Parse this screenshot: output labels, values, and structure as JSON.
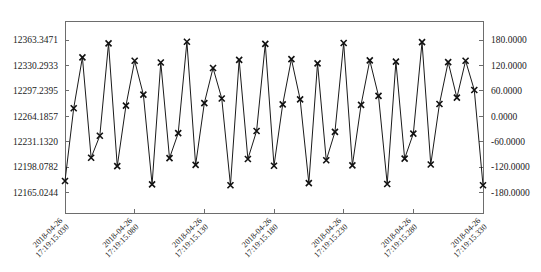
{
  "chart_data": {
    "type": "line",
    "title": "",
    "xlabel": "",
    "ylabel": "",
    "grid": false,
    "legend": "none",
    "marker": "x",
    "line_color": "#1a1a1a",
    "axis_color": "#6d6d6d",
    "background": "#ffffff",
    "left_axis": {
      "ticks": [
        12363.3471,
        12330.2933,
        12297.2395,
        12264.1857,
        12231.132,
        12198.0782,
        12165.0244
      ],
      "labels": [
        "12363.3471",
        "12330.2933",
        "12297.2395",
        "12264.1857",
        "12231.1320",
        "12198.0782",
        "12165.0244"
      ],
      "min": 12165.0244,
      "max": 12363.3471
    },
    "right_axis": {
      "ticks": [
        180.0,
        120.0,
        60.0,
        0.0,
        -60.0,
        -120.0,
        -180.0
      ],
      "labels": [
        "180.0000",
        "120.0000",
        "60.0000",
        "0.0000",
        "-60.0000",
        "-120.0000",
        "-180.0000"
      ],
      "min": -180.0,
      "max": 180.0
    },
    "x_tick_labels": [
      {
        "date": "2018-04-26",
        "time": "17:19:15.030"
      },
      {
        "date": "2018-04-26",
        "time": "17:19:15.080"
      },
      {
        "date": "2018-04-26",
        "time": "17:19:15.130"
      },
      {
        "date": "2018-04-26",
        "time": "17:19:15.180"
      },
      {
        "date": "2018-04-26",
        "time": "17:19:15.230"
      },
      {
        "date": "2018-04-26",
        "time": "17:19:15.280"
      },
      {
        "date": "2018-04-26",
        "time": "17:19:15.330"
      }
    ],
    "x": [
      0.0,
      1.0,
      2.0,
      3.0,
      4.0,
      5.0,
      6.0,
      7.0,
      8.0,
      9.0,
      10.0,
      11.0,
      12.0,
      13.0,
      14.0,
      15.0,
      16.0,
      17.0,
      18.0,
      19.0,
      20.0,
      21.0,
      22.0,
      23.0,
      24.0,
      25.0,
      26.0,
      27.0,
      28.0,
      29.0,
      30.0,
      31.0,
      32.0,
      33.0,
      34.0,
      35.0,
      36.0,
      37.0,
      38.0,
      39.0,
      40.0,
      41.0,
      42.0,
      43.0,
      44.0,
      45.0,
      46.0,
      47.0,
      48.0
    ],
    "values": [
      -153.0,
      19.0,
      139.0,
      -98.0,
      -46.0,
      172.0,
      -118.0,
      25.0,
      131.0,
      51.0,
      -161.0,
      127.0,
      -99.0,
      -40.0,
      176.0,
      -115.0,
      31.0,
      114.0,
      42.0,
      -163.0,
      133.0,
      -101.0,
      -35.0,
      171.0,
      -117.0,
      28.0,
      135.0,
      40.0,
      -158.0,
      125.0,
      -104.0,
      -37.0,
      173.0,
      -116.0,
      27.0,
      132.0,
      48.0,
      -160.0,
      129.0,
      -100.0,
      -41.0,
      175.0,
      -114.0,
      29.0,
      128.0,
      44.0,
      131.0,
      62.0,
      -163.0
    ],
    "series_name": "angle"
  }
}
